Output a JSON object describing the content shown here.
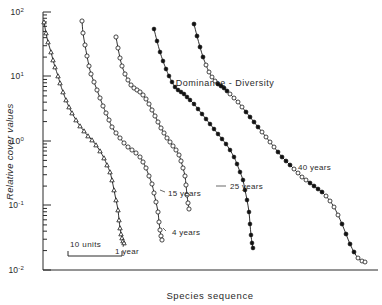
{
  "chart_data": {
    "type": "line",
    "title": "Dominance - Diversity",
    "xlabel": "Species sequence",
    "ylabel": "Relative cover values",
    "yscale": "log",
    "ylim": [
      0.01,
      100
    ],
    "ytick_labels": [
      "10",
      "10",
      "10",
      "10",
      "10"
    ],
    "ytick_exponents": [
      "2",
      "1",
      "0",
      "-1",
      "-2"
    ],
    "ytick_values": [
      100,
      10,
      1,
      0.1,
      0.01
    ],
    "grid": false,
    "legend": "inline-curve-labels",
    "scalebar_label": "10 units",
    "scalebar_units": 10,
    "series": [
      {
        "name": "1 year",
        "label": "1 year",
        "marker": "triangle-open",
        "label_x": 115,
        "label_y": 254,
        "points_px": [
          [
            44,
            22
          ],
          [
            46,
            33
          ],
          [
            48,
            42
          ],
          [
            51,
            52
          ],
          [
            53,
            60
          ],
          [
            55,
            67
          ],
          [
            58,
            76
          ],
          [
            60,
            83
          ],
          [
            63,
            92
          ],
          [
            66,
            100
          ],
          [
            69,
            107
          ],
          [
            72,
            113
          ],
          [
            76,
            120
          ],
          [
            80,
            126
          ],
          [
            84,
            131
          ],
          [
            88,
            136
          ],
          [
            92,
            140
          ],
          [
            96,
            145
          ],
          [
            100,
            151
          ],
          [
            104,
            158
          ],
          [
            107,
            165
          ],
          [
            110,
            172
          ],
          [
            112,
            180
          ],
          [
            114,
            190
          ],
          [
            116,
            200
          ],
          [
            118,
            210
          ],
          [
            119,
            220
          ],
          [
            120,
            228
          ],
          [
            121,
            234
          ],
          [
            122,
            238
          ],
          [
            123,
            241
          ],
          [
            124,
            243
          ]
        ],
        "values": [
          40,
          28,
          20,
          14,
          10.5,
          8,
          6,
          4.8,
          3.6,
          2.8,
          2.2,
          1.8,
          1.4,
          1.1,
          0.9,
          0.75,
          0.63,
          0.52,
          0.42,
          0.33,
          0.26,
          0.21,
          0.17,
          0.13,
          0.1,
          0.077,
          0.06,
          0.049,
          0.042,
          0.038,
          0.036,
          0.035
        ]
      },
      {
        "name": "4 years",
        "label": "4 years",
        "marker": "circle-open",
        "label_x": 172,
        "label_y": 235,
        "points_px": [
          [
            82,
            21
          ],
          [
            83,
            33
          ],
          [
            85,
            45
          ],
          [
            87,
            56
          ],
          [
            89,
            66
          ],
          [
            91,
            74
          ],
          [
            94,
            82
          ],
          [
            97,
            90
          ],
          [
            100,
            98
          ],
          [
            103,
            106
          ],
          [
            106,
            113
          ],
          [
            109,
            120
          ],
          [
            112,
            127
          ],
          [
            116,
            133
          ],
          [
            120,
            138
          ],
          [
            124,
            143
          ],
          [
            128,
            147
          ],
          [
            132,
            150
          ],
          [
            136,
            153
          ],
          [
            140,
            157
          ],
          [
            143,
            162
          ],
          [
            146,
            168
          ],
          [
            149,
            176
          ],
          [
            152,
            184
          ],
          [
            154,
            193
          ],
          [
            156,
            202
          ],
          [
            158,
            212
          ],
          [
            159,
            222
          ],
          [
            160,
            230
          ],
          [
            161,
            236
          ],
          [
            162,
            240
          ]
        ],
        "values": [
          42,
          29,
          20,
          14,
          10,
          8,
          6.3,
          5,
          4,
          3.2,
          2.6,
          2.1,
          1.7,
          1.4,
          1.15,
          0.95,
          0.82,
          0.72,
          0.64,
          0.55,
          0.47,
          0.39,
          0.31,
          0.25,
          0.2,
          0.16,
          0.12,
          0.095,
          0.075,
          0.065,
          0.058
        ]
      },
      {
        "name": "15 years",
        "label": "15 years",
        "marker": "circle-open",
        "label_x": 168,
        "label_y": 196,
        "points_px": [
          [
            116,
            37
          ],
          [
            118,
            48
          ],
          [
            120,
            58
          ],
          [
            122,
            66
          ],
          [
            125,
            74
          ],
          [
            128,
            80
          ],
          [
            131,
            85
          ],
          [
            134,
            88
          ],
          [
            137,
            90
          ],
          [
            140,
            92
          ],
          [
            143,
            95
          ],
          [
            146,
            99
          ],
          [
            149,
            104
          ],
          [
            152,
            110
          ],
          [
            155,
            116
          ],
          [
            158,
            122
          ],
          [
            161,
            128
          ],
          [
            164,
            133
          ],
          [
            167,
            138
          ],
          [
            170,
            142
          ],
          [
            173,
            146
          ],
          [
            176,
            150
          ],
          [
            179,
            155
          ],
          [
            181,
            161
          ],
          [
            183,
            168
          ],
          [
            185,
            176
          ],
          [
            186,
            185
          ],
          [
            187,
            195
          ],
          [
            188,
            203
          ],
          [
            189,
            209
          ]
        ],
        "values": [
          19,
          13,
          9.5,
          7.5,
          6,
          5,
          4.4,
          4.1,
          3.9,
          3.7,
          3.4,
          3.0,
          2.6,
          2.2,
          1.85,
          1.55,
          1.3,
          1.1,
          0.95,
          0.84,
          0.74,
          0.65,
          0.57,
          0.48,
          0.4,
          0.32,
          0.25,
          0.2,
          0.165,
          0.145
        ]
      },
      {
        "name": "25 years",
        "label": "25 years",
        "marker": "circle-filled",
        "label_x": 230,
        "label_y": 189,
        "points_px": [
          [
            154,
            29
          ],
          [
            157,
            41
          ],
          [
            160,
            52
          ],
          [
            163,
            61
          ],
          [
            166,
            69
          ],
          [
            169,
            76
          ],
          [
            172,
            82
          ],
          [
            175,
            87
          ],
          [
            178,
            90
          ],
          [
            181,
            92
          ],
          [
            184,
            94
          ],
          [
            187,
            97
          ],
          [
            190,
            100
          ],
          [
            194,
            104
          ],
          [
            198,
            109
          ],
          [
            202,
            114
          ],
          [
            206,
            119
          ],
          [
            210,
            124
          ],
          [
            214,
            129
          ],
          [
            218,
            134
          ],
          [
            222,
            139
          ],
          [
            226,
            144
          ],
          [
            230,
            150
          ],
          [
            234,
            157
          ],
          [
            237,
            164
          ],
          [
            240,
            172
          ],
          [
            243,
            180
          ],
          [
            245,
            190
          ],
          [
            247,
            200
          ],
          [
            249,
            212
          ],
          [
            250,
            224
          ],
          [
            251,
            235
          ],
          [
            252,
            243
          ],
          [
            253,
            248
          ]
        ],
        "values": [
          24,
          16,
          11,
          8.5,
          6.7,
          5.4,
          4.5,
          3.9,
          3.6,
          3.4,
          3.2,
          3.0,
          2.8,
          2.5,
          2.2,
          1.9,
          1.65,
          1.45,
          1.25,
          1.1,
          0.95,
          0.83,
          0.7,
          0.58,
          0.48,
          0.39,
          0.31,
          0.24,
          0.19,
          0.14,
          0.105,
          0.082,
          0.068,
          0.06
        ]
      },
      {
        "name": "40 years",
        "label": "40 years",
        "marker": "circle-mixed",
        "label_x": 298,
        "label_y": 170,
        "points_px": [
          [
            194,
            24
          ],
          [
            197,
            36
          ],
          [
            200,
            47
          ],
          [
            203,
            57
          ],
          [
            206,
            65
          ],
          [
            209,
            72
          ],
          [
            212,
            77
          ],
          [
            215,
            81
          ],
          [
            218,
            84
          ],
          [
            221,
            86
          ],
          [
            224,
            88
          ],
          [
            227,
            91
          ],
          [
            230,
            94
          ],
          [
            234,
            98
          ],
          [
            238,
            102
          ],
          [
            242,
            107
          ],
          [
            246,
            112
          ],
          [
            250,
            117
          ],
          [
            254,
            122
          ],
          [
            258,
            127
          ],
          [
            262,
            132
          ],
          [
            266,
            137
          ],
          [
            270,
            142
          ],
          [
            274,
            147
          ],
          [
            278,
            152
          ],
          [
            282,
            157
          ],
          [
            286,
            161
          ],
          [
            290,
            165
          ],
          [
            294,
            169
          ],
          [
            298,
            173
          ],
          [
            302,
            177
          ],
          [
            306,
            180
          ],
          [
            310,
            183
          ],
          [
            314,
            186
          ],
          [
            318,
            189
          ],
          [
            322,
            192
          ],
          [
            326,
            196
          ],
          [
            330,
            201
          ],
          [
            334,
            207
          ],
          [
            338,
            215
          ],
          [
            342,
            224
          ],
          [
            346,
            234
          ],
          [
            350,
            244
          ],
          [
            354,
            252
          ],
          [
            358,
            258
          ],
          [
            362,
            261
          ],
          [
            365,
            262
          ]
        ],
        "values": [
          28,
          18,
          12.5,
          9,
          7.2,
          5.9,
          5.2,
          4.7,
          4.4,
          4.2,
          4.0,
          3.7,
          3.5,
          3.2,
          2.9,
          2.6,
          2.3,
          2.1,
          1.85,
          1.65,
          1.45,
          1.3,
          1.15,
          1.02,
          0.9,
          0.8,
          0.72,
          0.65,
          0.59,
          0.53,
          0.48,
          0.44,
          0.41,
          0.38,
          0.35,
          0.32,
          0.29,
          0.25,
          0.21,
          0.17,
          0.13,
          0.1,
          0.075,
          0.058,
          0.048,
          0.044,
          0.042
        ]
      }
    ]
  },
  "axes": {
    "plot_left_px": 43,
    "plot_bottom_px": 270,
    "plot_top_px": 12,
    "plot_right_px": 378
  },
  "scalebar": {
    "label": "10 units",
    "x1_px": 68,
    "x2_px": 122,
    "y_px": 250
  }
}
